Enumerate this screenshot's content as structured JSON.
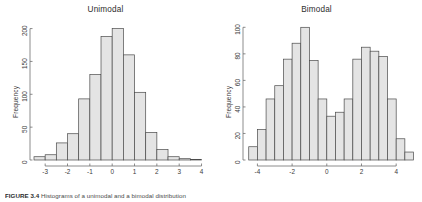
{
  "figure": {
    "caption_label": "FIGURE 3.4",
    "caption_text": "Histograms of a unimodal and a bimodal distribution"
  },
  "chart_data": [
    {
      "type": "bar",
      "title": "Unimodal",
      "xlabel": "",
      "ylabel": "Frequency",
      "xlim": [
        -3.5,
        4.2
      ],
      "ylim": [
        0,
        210
      ],
      "xticks": [
        -3,
        -2,
        -1,
        0,
        1,
        2,
        3,
        4
      ],
      "yticks": [
        0,
        50,
        100,
        150,
        200
      ],
      "grid": false,
      "legend": "none",
      "bin_width": 0.5,
      "bin_starts": [
        -3.5,
        -3.0,
        -2.5,
        -2.0,
        -1.5,
        -1.0,
        -0.5,
        0.0,
        0.5,
        1.0,
        1.5,
        2.0,
        2.5,
        3.0,
        3.5
      ],
      "values": [
        5,
        8,
        26,
        40,
        93,
        130,
        188,
        200,
        160,
        103,
        42,
        16,
        5,
        2,
        1
      ]
    },
    {
      "type": "bar",
      "title": "Bimodal",
      "xlabel": "",
      "ylabel": "Frequency",
      "xlim": [
        -4.6,
        5.2
      ],
      "ylim": [
        0,
        104
      ],
      "xticks": [
        -4,
        -2,
        0,
        2,
        4
      ],
      "yticks": [
        0,
        20,
        40,
        60,
        80,
        100
      ],
      "grid": false,
      "legend": "none",
      "bin_width": 0.5,
      "bin_starts": [
        -4.5,
        -4.0,
        -3.5,
        -3.0,
        -2.5,
        -2.0,
        -1.5,
        -1.0,
        -0.5,
        0.0,
        0.5,
        1.0,
        1.5,
        2.0,
        2.5,
        3.0,
        3.5,
        4.0,
        4.5
      ],
      "values": [
        10,
        23,
        46,
        56,
        76,
        88,
        100,
        75,
        46,
        33,
        36,
        46,
        76,
        85,
        82,
        78,
        46,
        16,
        6,
        2
      ]
    }
  ]
}
